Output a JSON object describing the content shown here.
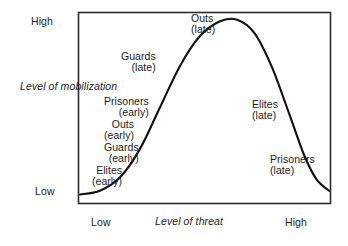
{
  "chart_data": {
    "type": "line",
    "title": "",
    "xlabel": "Level of threat",
    "ylabel": "Level of mobilization",
    "x_ticks": [
      "Low",
      "High"
    ],
    "y_ticks": [
      "Low",
      "High"
    ],
    "xlim": [
      0,
      1
    ],
    "ylim": [
      0,
      1
    ],
    "grid": false,
    "legend": "none",
    "curve_description": "bell-shaped inverted-U curve",
    "points": [
      {
        "x": 0.0,
        "y": 0.04
      },
      {
        "x": 0.08,
        "y": 0.06
      },
      {
        "x": 0.16,
        "y": 0.13
      },
      {
        "x": 0.24,
        "y": 0.28
      },
      {
        "x": 0.32,
        "y": 0.5
      },
      {
        "x": 0.4,
        "y": 0.72
      },
      {
        "x": 0.48,
        "y": 0.88
      },
      {
        "x": 0.56,
        "y": 0.96
      },
      {
        "x": 0.63,
        "y": 0.97
      },
      {
        "x": 0.7,
        "y": 0.9
      },
      {
        "x": 0.77,
        "y": 0.72
      },
      {
        "x": 0.84,
        "y": 0.47
      },
      {
        "x": 0.9,
        "y": 0.25
      },
      {
        "x": 0.95,
        "y": 0.12
      },
      {
        "x": 1.0,
        "y": 0.06
      }
    ],
    "annotations": [
      {
        "id": "outs-late",
        "group": "Outs",
        "phase": "(late)",
        "x": 0.6,
        "y": 1.02,
        "side": "top"
      },
      {
        "id": "guards-late",
        "group": "Guards",
        "phase": "(late)",
        "x": 0.3,
        "y": 0.8,
        "side": "left"
      },
      {
        "id": "prisoners-early",
        "group": "Prisoners",
        "phase": "(early)",
        "x": 0.22,
        "y": 0.56,
        "side": "left"
      },
      {
        "id": "outs-early",
        "group": "Outs",
        "phase": "(early)",
        "x": 0.19,
        "y": 0.44,
        "side": "left"
      },
      {
        "id": "guards-early",
        "group": "Guards",
        "phase": "(early)",
        "x": 0.16,
        "y": 0.31,
        "side": "left"
      },
      {
        "id": "elites-early",
        "group": "Elites",
        "phase": "(early)",
        "x": 0.11,
        "y": 0.18,
        "side": "left"
      },
      {
        "id": "elites-late",
        "group": "Elites",
        "phase": "(late)",
        "x": 0.76,
        "y": 0.54,
        "side": "right"
      },
      {
        "id": "prisoners-late",
        "group": "Prisoners",
        "phase": "(late)",
        "x": 0.89,
        "y": 0.24,
        "side": "right"
      }
    ]
  },
  "axes": {
    "y_high": "High",
    "y_low": "Low",
    "y_title_line1": "Level of",
    "y_title_line2": "mobilization",
    "x_low": "Low",
    "x_high": "High",
    "x_title_line1": "Level of",
    "x_title_line2": "threat"
  },
  "labels": {
    "outs_late": {
      "name": "Outs",
      "phase": "(late)"
    },
    "guards_late": {
      "name": "Guards",
      "phase": "(late)"
    },
    "prisoners_early": {
      "name": "Prisoners",
      "phase": "(early)"
    },
    "outs_early": {
      "name": "Outs",
      "phase": "(early)"
    },
    "guards_early": {
      "name": "Guards",
      "phase": "(early)"
    },
    "elites_early": {
      "name": "Elites",
      "phase": "(early)"
    },
    "elites_late": {
      "name": "Elites",
      "phase": "(late)"
    },
    "prisoners_late": {
      "name": "Prisoners",
      "phase": "(late)"
    }
  },
  "style": {
    "frame_color": "#2b2b2b",
    "curve_color": "#111111",
    "background": "#ffffff"
  }
}
